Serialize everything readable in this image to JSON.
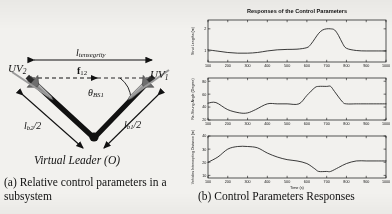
{
  "figure": {
    "panel_a": {
      "caption": "(a) Relative control parameters in a subsystem",
      "labels": {
        "uv2": "UV",
        "uv2_sub": "2",
        "uv1": "UV",
        "uv1_sub": "1",
        "l_tensegrity": "l",
        "l_tensegrity_sub": "tensegrity",
        "f12": "f",
        "f12_sub": "12",
        "theta": "θ",
        "theta_sub": "BS1",
        "lb2": "l",
        "lb2_sub": "b2",
        "lb2_tail": "/2",
        "lb1": "l",
        "lb1_sub": "b1",
        "lb1_tail": "/2",
        "virtual_leader": "Virtual Leader (O)"
      }
    },
    "panel_b": {
      "caption": "(b) Control Parameters Responses",
      "title": "Responses of the Control Parameters"
    }
  },
  "chart_data": [
    {
      "type": "line",
      "title": "Responses of the Control Parameters",
      "ylabel": "Strut Lengths (m)",
      "xlabel": "",
      "xlim": [
        100,
        1000
      ],
      "ylim": [
        0.5,
        2.4
      ],
      "xticks": [
        100,
        200,
        300,
        400,
        500,
        600,
        700,
        800,
        900,
        1000
      ],
      "xticklabels": [
        "100",
        "200",
        "300",
        "400",
        "500",
        "600",
        "700",
        "800",
        "900",
        "1000"
      ],
      "yticks": [
        1,
        2
      ],
      "yticklabels": [
        "1",
        "2"
      ],
      "grid": false,
      "series": [
        {
          "name": "strut length",
          "x": [
            100,
            150,
            200,
            250,
            300,
            350,
            400,
            450,
            500,
            550,
            600,
            620,
            640,
            660,
            680,
            700,
            720,
            740,
            760,
            780,
            800,
            850,
            900,
            950,
            1000
          ],
          "values": [
            1.05,
            0.99,
            0.93,
            0.9,
            0.9,
            0.93,
            1.0,
            1.05,
            1.07,
            1.08,
            1.15,
            1.3,
            1.55,
            1.8,
            1.95,
            2.0,
            2.0,
            1.95,
            1.7,
            1.35,
            1.12,
            1.02,
            1.0,
            1.0,
            1.0
          ]
        }
      ]
    },
    {
      "type": "line",
      "title": "",
      "ylabel": "Re-Strung Angle (Degree)",
      "xlabel": "",
      "xlim": [
        100,
        1000
      ],
      "ylim": [
        20,
        85
      ],
      "xticks": [
        100,
        200,
        300,
        400,
        500,
        600,
        700,
        800,
        900,
        1000
      ],
      "xticklabels": [
        "100",
        "200",
        "300",
        "400",
        "500",
        "600",
        "700",
        "800",
        "900",
        "1000"
      ],
      "yticks": [
        20,
        40,
        60,
        80
      ],
      "yticklabels": [
        "20",
        "40",
        "60",
        "80"
      ],
      "grid": false,
      "series": [
        {
          "name": "re-strung angle",
          "x": [
            100,
            140,
            200,
            260,
            300,
            340,
            400,
            450,
            500,
            560,
            600,
            640,
            660,
            700,
            720,
            740,
            780,
            800,
            850,
            900,
            1000
          ],
          "values": [
            46,
            47,
            36,
            31,
            31,
            36,
            45,
            45,
            45,
            45,
            58,
            70,
            72,
            72,
            72,
            64,
            48,
            45,
            45,
            45,
            45
          ]
        }
      ]
    },
    {
      "type": "line",
      "title": "",
      "ylabel": "Vehicles Intercepting Distance (m)",
      "xlabel": "Time (s)",
      "xlim": [
        100,
        1000
      ],
      "ylim": [
        8,
        40
      ],
      "xticks": [
        100,
        200,
        300,
        400,
        500,
        600,
        700,
        800,
        900,
        1000
      ],
      "xticklabels": [
        "100",
        "200",
        "300",
        "400",
        "500",
        "600",
        "700",
        "800",
        "900",
        "1000"
      ],
      "yticks": [
        10,
        20,
        30,
        40
      ],
      "yticklabels": [
        "10",
        "20",
        "30",
        "40"
      ],
      "grid": false,
      "series": [
        {
          "name": "intercepting distance",
          "x": [
            100,
            150,
            200,
            250,
            300,
            350,
            400,
            450,
            500,
            550,
            600,
            640,
            660,
            700,
            720,
            760,
            800,
            850,
            900,
            950,
            1000
          ],
          "values": [
            20,
            24,
            30,
            32,
            32,
            31,
            27,
            24,
            22,
            21,
            19,
            15,
            13,
            13,
            13,
            16,
            19,
            21,
            21,
            21,
            21
          ]
        }
      ]
    }
  ]
}
